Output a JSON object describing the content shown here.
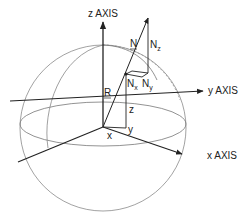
{
  "diagram": {
    "type": "3d-coordinate-sphere",
    "labels": {
      "z_axis": "z AXIS",
      "y_axis": "y AXIS",
      "x_axis": "x AXIS",
      "normal_vector": "N",
      "radius": "R",
      "nx_base": "N",
      "nx_sub": "x",
      "ny_base": "N",
      "ny_sub": "y",
      "nz_base": "N",
      "nz_sub": "z",
      "coord_x": "x",
      "coord_y": "y",
      "coord_z": "z"
    },
    "colors": {
      "ink": "#222222",
      "sphere": "#8a8a8a",
      "background": "#ffffff"
    }
  }
}
